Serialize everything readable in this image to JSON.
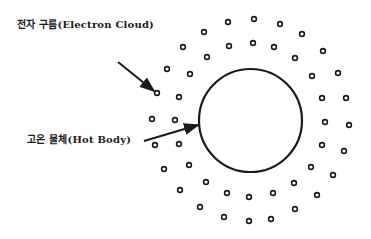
{
  "labels": {
    "electron_cloud": "전자 구름(Electron Cloud)",
    "hot_body": "고온 물체(Hot Body)"
  },
  "colors": {
    "ink": "#1a1a1a",
    "background": "#ffffff"
  },
  "hot_body_circle": {
    "cx": 250.5,
    "cy": 120.5,
    "r": 51.5
  },
  "arrows": {
    "electron_cloud": {
      "x1": 118,
      "y1": 62,
      "x2": 154,
      "y2": 91
    },
    "hot_body": {
      "x1": 144,
      "y1": 141,
      "x2": 198,
      "y2": 125
    }
  },
  "electrons": [
    [
      228,
      22
    ],
    [
      254,
      19
    ],
    [
      280,
      24
    ],
    [
      302,
      34
    ],
    [
      204,
      32
    ],
    [
      183,
      47
    ],
    [
      229,
      46
    ],
    [
      253,
      43
    ],
    [
      274,
      47
    ],
    [
      295,
      58
    ],
    [
      323,
      51
    ],
    [
      207,
      57
    ],
    [
      167,
      69
    ],
    [
      190,
      74
    ],
    [
      312,
      76
    ],
    [
      338,
      73
    ],
    [
      157,
      93
    ],
    [
      179,
      97
    ],
    [
      322,
      98
    ],
    [
      346,
      98
    ],
    [
      152,
      119
    ],
    [
      175,
      120
    ],
    [
      325,
      122
    ],
    [
      349,
      125
    ],
    [
      155,
      145
    ],
    [
      179,
      144
    ],
    [
      322,
      145
    ],
    [
      344,
      151
    ],
    [
      164,
      169
    ],
    [
      189,
      165
    ],
    [
      311,
      167
    ],
    [
      333,
      175
    ],
    [
      206,
      182
    ],
    [
      180,
      190
    ],
    [
      227,
      193
    ],
    [
      249,
      197
    ],
    [
      273,
      193
    ],
    [
      294,
      183
    ],
    [
      317,
      195
    ],
    [
      200,
      207
    ],
    [
      224,
      217
    ],
    [
      249,
      221
    ],
    [
      271,
      219
    ],
    [
      295,
      209
    ]
  ]
}
